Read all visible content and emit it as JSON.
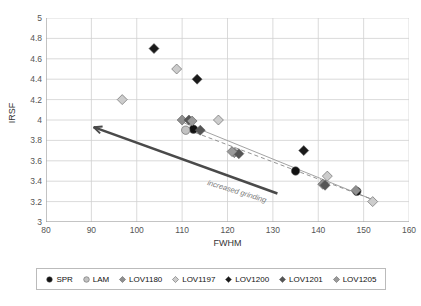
{
  "chart_data": {
    "type": "scatter",
    "title": "",
    "xlabel": "FWHM",
    "ylabel": "IRSF",
    "xlim": [
      80,
      160
    ],
    "ylim": [
      3,
      5
    ],
    "xticks": [
      80,
      90,
      100,
      110,
      120,
      130,
      140,
      150,
      160
    ],
    "yticks": [
      3,
      3.2,
      3.4,
      3.6,
      3.8,
      4,
      4.2,
      4.4,
      4.6,
      4.8,
      5
    ],
    "grid": true,
    "legend_position": "bottom",
    "annotations": [
      {
        "text": "increased grinding",
        "type": "arrow-label",
        "arrow_from": [
          131,
          3.28
        ],
        "arrow_to": [
          90.5,
          3.93
        ]
      }
    ],
    "trendlines": [
      {
        "name": "solid-fit",
        "style": "solid",
        "color": "#999999",
        "from": [
          110.5,
          3.97
        ],
        "to": [
          152.5,
          3.21
        ]
      },
      {
        "name": "dashed-fit",
        "style": "dashed",
        "color": "#888888",
        "from": [
          111.5,
          3.9
        ],
        "to": [
          152.0,
          3.22
        ]
      }
    ],
    "series": [
      {
        "name": "SPR",
        "marker": "circle",
        "color": "#111111",
        "points": [
          {
            "x": 112.5,
            "y": 3.91
          },
          {
            "x": 135.0,
            "y": 3.5
          },
          {
            "x": 148.5,
            "y": 3.3
          }
        ]
      },
      {
        "name": "LAM",
        "marker": "circle",
        "color": "#c2c2c2",
        "points": [
          {
            "x": 110.8,
            "y": 3.9
          }
        ]
      },
      {
        "name": "LOV1180",
        "marker": "diamond",
        "color": "#8f8f8f",
        "points": [
          {
            "x": 110.0,
            "y": 4.0
          },
          {
            "x": 121.5,
            "y": 3.68
          },
          {
            "x": 141.0,
            "y": 3.37
          },
          {
            "x": 148.3,
            "y": 3.31
          }
        ]
      },
      {
        "name": "LOV1197",
        "marker": "diamond",
        "color": "#cccccc",
        "points": [
          {
            "x": 96.8,
            "y": 4.2
          },
          {
            "x": 108.8,
            "y": 4.5
          },
          {
            "x": 118.0,
            "y": 4.0
          },
          {
            "x": 142.0,
            "y": 3.45
          },
          {
            "x": 152.0,
            "y": 3.2
          }
        ]
      },
      {
        "name": "LOV1200",
        "marker": "diamond",
        "color": "#1a1a1a",
        "points": [
          {
            "x": 103.8,
            "y": 4.7
          },
          {
            "x": 113.3,
            "y": 4.4
          },
          {
            "x": 136.8,
            "y": 3.7
          }
        ]
      },
      {
        "name": "LOV1201",
        "marker": "diamond",
        "color": "#555555",
        "points": [
          {
            "x": 111.5,
            "y": 4.0
          },
          {
            "x": 114.0,
            "y": 3.9
          },
          {
            "x": 122.5,
            "y": 3.67
          },
          {
            "x": 141.5,
            "y": 3.36
          }
        ]
      },
      {
        "name": "LOV1205",
        "marker": "diamond",
        "color": "#9a9a9a",
        "points": [
          {
            "x": 112.2,
            "y": 3.99
          },
          {
            "x": 121.0,
            "y": 3.69
          }
        ]
      }
    ]
  },
  "axes": {
    "y_title": "IRSF",
    "x_title": "FWHM",
    "y_tick_labels": [
      "5",
      "4.8",
      "4.6",
      "4.4",
      "4.2",
      "4",
      "3.8",
      "3.6",
      "3.4",
      "3.2",
      "3"
    ],
    "x_tick_labels": [
      "80",
      "90",
      "100",
      "110",
      "120",
      "130",
      "140",
      "150",
      "160"
    ]
  },
  "annotation": {
    "grinding_label": "increased grinding"
  },
  "legend": {
    "items": [
      {
        "label": "SPR",
        "marker": "circle",
        "color": "#111111"
      },
      {
        "label": "LAM",
        "marker": "circle",
        "color": "#c2c2c2"
      },
      {
        "label": "LOV1180",
        "marker": "diamond",
        "color": "#8f8f8f"
      },
      {
        "label": "LOV1197",
        "marker": "diamond",
        "color": "#cccccc"
      },
      {
        "label": "LOV1200",
        "marker": "diamond",
        "color": "#1a1a1a"
      },
      {
        "label": "LOV1201",
        "marker": "diamond",
        "color": "#555555"
      },
      {
        "label": "LOV1205",
        "marker": "diamond",
        "color": "#9a9a9a"
      }
    ]
  }
}
